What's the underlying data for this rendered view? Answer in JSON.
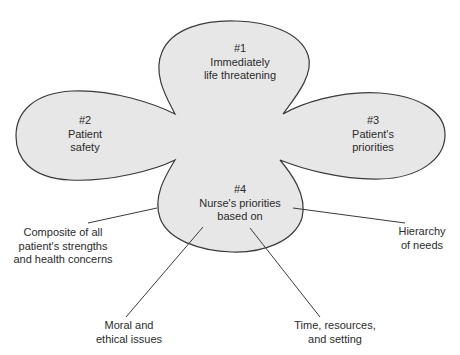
{
  "diagram": {
    "type": "priority-setting-blob",
    "colors": {
      "fill": "#e7e7e7",
      "stroke": "#3a3a3a",
      "text": "#2b2b2b",
      "background": "#ffffff"
    },
    "lobes": [
      {
        "id": "top",
        "number": "#1",
        "lines": [
          "Immediately",
          "life threatening"
        ]
      },
      {
        "id": "left",
        "number": "#2",
        "lines": [
          "Patient",
          "safety"
        ]
      },
      {
        "id": "right",
        "number": "#3",
        "lines": [
          "Patient's",
          "priorities"
        ]
      },
      {
        "id": "bottom",
        "number": "#4",
        "lines": [
          "Nurse's priorities",
          "based on"
        ]
      }
    ],
    "factors": [
      {
        "id": "composite",
        "lines": [
          "Composite of all",
          "patient's strengths",
          "and health concerns"
        ]
      },
      {
        "id": "hierarchy",
        "lines": [
          "Hierarchy",
          "of needs"
        ]
      },
      {
        "id": "moral",
        "lines": [
          "Moral and",
          "ethical issues"
        ]
      },
      {
        "id": "time",
        "lines": [
          "Time, resources,",
          "and setting"
        ]
      }
    ]
  }
}
